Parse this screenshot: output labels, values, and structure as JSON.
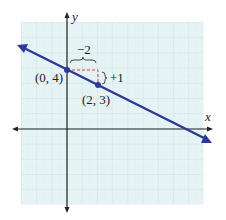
{
  "graph": {
    "x_axis_label": "x",
    "y_axis_label": "y",
    "grid": {
      "x_min": -3,
      "x_max": 9,
      "y_min": -5,
      "y_max": 7,
      "background": "#e6f3f5",
      "line_color": "#b9cfd4"
    },
    "line": {
      "equation": "y = -1/2 x + 4",
      "color": "#2b3a9a",
      "slope": -0.5,
      "intercept": 4
    },
    "points": [
      {
        "label": "(0, 4)",
        "x": 0,
        "y": 4
      },
      {
        "label": "(2, 3)",
        "x": 2,
        "y": 3
      }
    ],
    "run_label": "−2",
    "rise_label": "+1",
    "slope_triangle_color": "#d83a3a"
  }
}
